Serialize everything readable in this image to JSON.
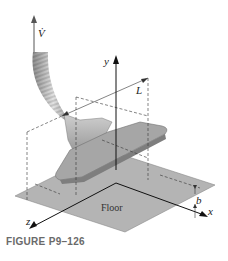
{
  "figure": {
    "caption": "FIGURE P9–126",
    "labels": {
      "flow_rate": "V̇",
      "y_axis": "y",
      "x_axis": "x",
      "z_axis": "z",
      "length": "L",
      "gap": "b",
      "floor": "Floor"
    },
    "colors": {
      "floor": "#b4b4b4",
      "floor_edge": "#8a8a8a",
      "nozzle": "#9a9a9a",
      "nozzle_light": "#c9c9c9",
      "axis": "#111111",
      "dashed": "#333333",
      "caption": "#6a6a6a"
    }
  }
}
